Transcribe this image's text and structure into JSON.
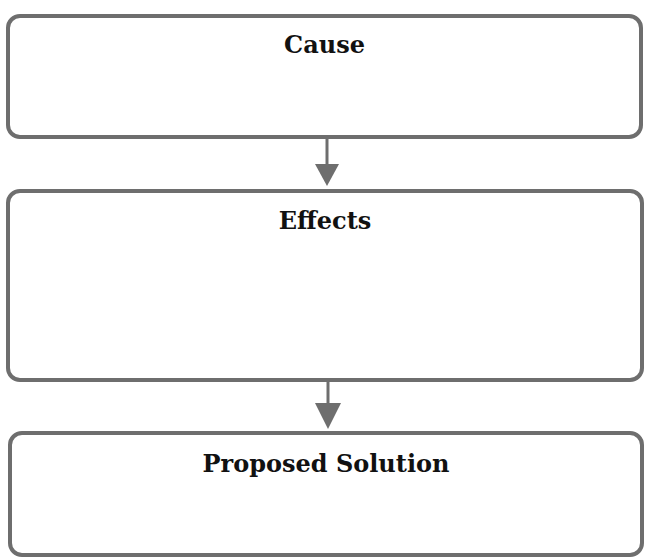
{
  "diagram": {
    "type": "flowchart",
    "boxes": [
      {
        "id": "cause",
        "title": "Cause",
        "content": ""
      },
      {
        "id": "effects",
        "title": "Effects",
        "content": ""
      },
      {
        "id": "proposed-solution",
        "title": "Proposed Solution",
        "content": ""
      }
    ],
    "connections": [
      {
        "from": "cause",
        "to": "effects"
      },
      {
        "from": "effects",
        "to": "proposed-solution"
      }
    ],
    "colors": {
      "border": "#6e6e6e",
      "arrow": "#6e6e6e",
      "text": "#111111",
      "background": "#ffffff"
    }
  }
}
